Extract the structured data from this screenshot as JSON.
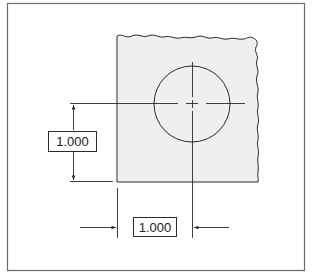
{
  "figure": {
    "type": "engineering-dimension-drawing",
    "colors": {
      "line": "#2a2a2a",
      "plate_fill": "#efefef",
      "frame": "#6a6a6a",
      "background": "#ffffff"
    }
  },
  "dimensions": {
    "vertical": {
      "value": "1.000",
      "from": "bottom-edge",
      "to": "hole-center"
    },
    "horizontal": {
      "value": "1.000",
      "from": "left-edge",
      "to": "hole-center"
    }
  },
  "hole": {
    "shape": "circle",
    "centerlines": true
  }
}
